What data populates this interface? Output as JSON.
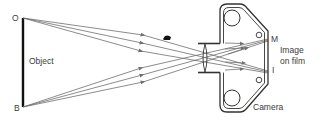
{
  "diagram": {
    "labels": {
      "top_point": "O",
      "bottom_point": "B",
      "object": "Object",
      "image_top": "M",
      "image_bottom": "I",
      "image_on_film_line1": "Image",
      "image_on_film_line2": "on film",
      "camera": "Camera"
    },
    "colors": {
      "object_line": "#111111",
      "rays": "#6e6e6e",
      "camera_outline": "#333333",
      "text": "#3a3a3a"
    }
  }
}
